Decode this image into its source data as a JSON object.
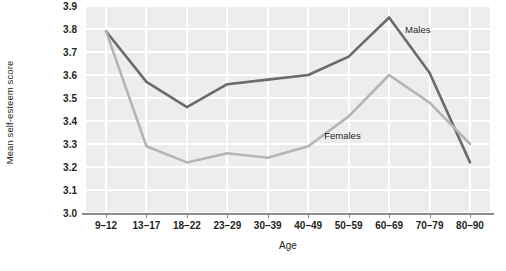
{
  "chart_data": {
    "type": "line",
    "title": "",
    "xlabel": "Age",
    "ylabel": "Mean self-esteem score",
    "categories": [
      "9–12",
      "13–17",
      "18–22",
      "23–29",
      "30–39",
      "40–49",
      "50–59",
      "60–69",
      "70–79",
      "80–90"
    ],
    "ylim": [
      3.0,
      3.9
    ],
    "yticks": [
      "3.0",
      "3.1",
      "3.2",
      "3.3",
      "3.4",
      "3.5",
      "3.6",
      "3.7",
      "3.8",
      "3.9"
    ],
    "grid": true,
    "legend_position": "inline-annotations",
    "series": [
      {
        "name": "Males",
        "color": "#6b6b6b",
        "values": [
          3.79,
          3.57,
          3.46,
          3.56,
          3.58,
          3.6,
          3.68,
          3.85,
          3.61,
          3.22
        ]
      },
      {
        "name": "Females",
        "color": "#b5b5b5",
        "values": [
          3.79,
          3.29,
          3.22,
          3.26,
          3.24,
          3.29,
          3.42,
          3.6,
          3.48,
          3.3
        ]
      }
    ],
    "annotations": [
      {
        "text": "Males",
        "series": "Males"
      },
      {
        "text": "Females",
        "series": "Females"
      }
    ]
  },
  "axis": {
    "y_title": "Mean self-esteem score",
    "x_title": "Age",
    "y_ticks": [
      "3.9",
      "3.8",
      "3.7",
      "3.6",
      "3.5",
      "3.4",
      "3.3",
      "3.2",
      "3.1",
      "3.0"
    ],
    "x_ticks": [
      "9–12",
      "13–17",
      "18–22",
      "23–29",
      "30–39",
      "40–49",
      "50–59",
      "60–69",
      "70–79",
      "80–90"
    ]
  },
  "labels": {
    "males": "Males",
    "females": "Females"
  },
  "colors": {
    "males_line": "#6b6b6b",
    "females_line": "#b5b5b5",
    "plot_background": "#ededed",
    "gridline": "#ffffff",
    "axis_line": "#8c8c8c",
    "text": "#231f20"
  }
}
